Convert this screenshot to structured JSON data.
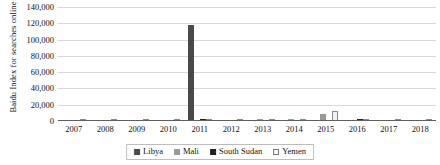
{
  "chart_data": {
    "type": "bar",
    "title": "",
    "xlabel": "",
    "ylabel": "Baidu Index for searches online",
    "ylim": [
      0,
      140000
    ],
    "ytick_labels": [
      "140,000",
      "120,000",
      "100,000",
      "80,000",
      "60,000",
      "40,000",
      "20,000",
      "0"
    ],
    "ytick_values": [
      140000,
      120000,
      100000,
      80000,
      60000,
      40000,
      20000,
      0
    ],
    "grid": true,
    "legend_position": "bottom",
    "categories": [
      "2007",
      "2008",
      "2009",
      "2010",
      "2011",
      "2012",
      "2013",
      "2014",
      "2015",
      "2016",
      "2017",
      "2018"
    ],
    "series": [
      {
        "name": "Libya",
        "color": "#4a4a4a",
        "values": [
          0,
          0,
          0,
          0,
          118000,
          1500,
          0,
          900,
          0,
          1200,
          0,
          0
        ]
      },
      {
        "name": "Mali",
        "color": "#9a9a9a",
        "values": [
          0,
          0,
          0,
          0,
          1000,
          1800,
          2200,
          2600,
          9000,
          1000,
          0,
          0
        ]
      },
      {
        "name": "South Sudan",
        "color": "#222222",
        "values": [
          0,
          0,
          0,
          0,
          2600,
          0,
          0,
          0,
          0,
          2000,
          0,
          0
        ]
      },
      {
        "name": "Yemen",
        "color": "#f2f2f2",
        "values": [
          0,
          0,
          0,
          0,
          700,
          1400,
          0,
          700,
          12000,
          700,
          0,
          0
        ]
      }
    ]
  }
}
